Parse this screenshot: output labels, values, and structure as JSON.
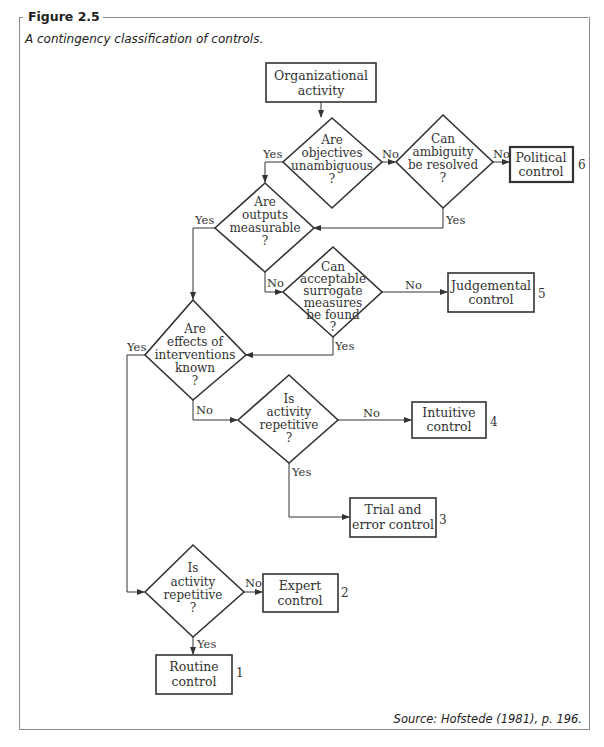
{
  "figure": {
    "label": "Figure 2.5",
    "caption": "A contingency classification of controls.",
    "source": "Source: Hofstede (1981), p. 196."
  },
  "nodes": {
    "start": {
      "lines": [
        "Organizational",
        "activity"
      ]
    },
    "d_objectives": {
      "lines": [
        "Are",
        "objectives",
        "unambiguous",
        "?"
      ]
    },
    "d_ambiguity": {
      "lines": [
        "Can",
        "ambiguity",
        "be resolved",
        "?"
      ]
    },
    "d_outputs": {
      "lines": [
        "Are",
        "outputs",
        "measurable",
        "?"
      ]
    },
    "d_surrogate": {
      "lines": [
        "Can",
        "acceptable",
        "surrogate",
        "measures",
        "be found",
        "?"
      ]
    },
    "d_effects": {
      "lines": [
        "Are",
        "effects of",
        "interventions",
        "known",
        "?"
      ]
    },
    "d_repetitive_a": {
      "lines": [
        "Is",
        "activity",
        "repetitive",
        "?"
      ]
    },
    "d_repetitive_b": {
      "lines": [
        "Is",
        "activity",
        "repetitive",
        "?"
      ]
    },
    "political": {
      "lines": [
        "Political",
        "control"
      ],
      "number": "6"
    },
    "judgemental": {
      "lines": [
        "Judgemental",
        "control"
      ],
      "number": "5"
    },
    "intuitive": {
      "lines": [
        "Intuitive",
        "control"
      ],
      "number": "4"
    },
    "trial": {
      "lines": [
        "Trial and",
        "error control"
      ],
      "number": "3"
    },
    "expert": {
      "lines": [
        "Expert",
        "control"
      ],
      "number": "2"
    },
    "routine": {
      "lines": [
        "Routine",
        "control"
      ],
      "number": "1"
    }
  },
  "edge_labels": {
    "yes": "Yes",
    "no": "No"
  }
}
